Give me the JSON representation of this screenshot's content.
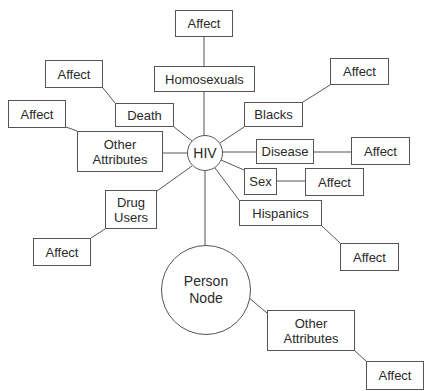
{
  "diagram": {
    "center": {
      "label": "HIV"
    },
    "person": {
      "label": "Person\nNode"
    },
    "nodes": {
      "homosexuals": "Homosexuals",
      "death": "Death",
      "other_attributes_left": "Other\nAttributes",
      "drug_users": "Drug\nUsers",
      "blacks": "Blacks",
      "disease": "Disease",
      "sex": "Sex",
      "hispanics": "Hispanics",
      "other_attributes_bottom": "Other\nAttributes"
    },
    "affect_label": "Affect",
    "affects": {
      "top": "Affect",
      "death": "Affect",
      "left": "Affect",
      "drug": "Affect",
      "blacks": "Affect",
      "disease": "Affect",
      "sex": "Affect",
      "hispanics": "Affect",
      "bottom": "Affect"
    }
  }
}
